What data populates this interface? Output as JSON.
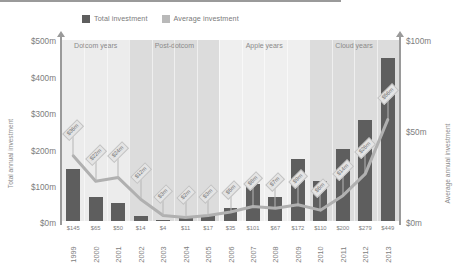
{
  "legend": {
    "items": [
      {
        "label": "Total investment",
        "color": "#5e5e5e",
        "key": "total"
      },
      {
        "label": "Average investment",
        "color": "#b9b9b9",
        "key": "average"
      }
    ]
  },
  "axes": {
    "left_title": "Total annual investment",
    "right_title": "Average annual investment",
    "left_ticks": [
      "$500m",
      "$400m",
      "$300m",
      "$200m",
      "$100m",
      "$0m"
    ],
    "right_ticks": [
      "$100m",
      "$50m",
      "$0m"
    ]
  },
  "chart_data": {
    "type": "bar",
    "title": "",
    "subtitle": "",
    "xlabel": "",
    "ylabel": "Total annual investment",
    "y2label": "Average annual investment",
    "grid": false,
    "legend_position": "top",
    "categories": [
      "1999",
      "2000",
      "2001",
      "2002",
      "2003",
      "2004",
      "2005",
      "2006",
      "2007",
      "2008",
      "2009",
      "2010",
      "2011",
      "2012",
      "2013"
    ],
    "ylim": [
      0,
      500
    ],
    "y2lim": [
      0,
      100
    ],
    "yticks": [
      0,
      100,
      200,
      300,
      400,
      500
    ],
    "y2ticks": [
      0,
      50,
      100
    ],
    "ytick_labels": [
      "$0m",
      "$100m",
      "$200m",
      "$300m",
      "$400m",
      "$500m"
    ],
    "y2tick_labels": [
      "$0m",
      "$50m",
      "$100m"
    ],
    "series": [
      {
        "name": "Total investment",
        "type": "bar",
        "axis": "left",
        "color": "#5e5e5e",
        "values": [
          145,
          65,
          50,
          14,
          4,
          11,
          17,
          35,
          101,
          67,
          172,
          110,
          200,
          279,
          449
        ],
        "data_labels": [
          "$145",
          "$65",
          "$50",
          "$14",
          "$4",
          "$11",
          "$17",
          "$35",
          "$101",
          "$67",
          "$172",
          "$110",
          "$200",
          "$279",
          "$449"
        ]
      },
      {
        "name": "Average investment",
        "type": "line",
        "axis": "right",
        "color": "#b0b0b0",
        "values": [
          36,
          22,
          24,
          12,
          3,
          2,
          3,
          5,
          8,
          7,
          9,
          6,
          14,
          26,
          56
        ],
        "data_labels": [
          "$36m",
          "$22m",
          "$24m",
          "$12m",
          "$3m",
          "$2m",
          "$3m",
          "$5m",
          "$8m",
          "$7m",
          "$9m",
          "$6m",
          "$14m",
          "$26m",
          "$56m"
        ]
      }
    ],
    "bands": [
      {
        "label": "Dotcom years",
        "start": "1999",
        "end": "2001",
        "color": "#ececec"
      },
      {
        "label": "Post-dotcom",
        "start": "2002",
        "end": "2005",
        "color": "#dcdcdc"
      },
      {
        "label": "Apple years",
        "start": "2006",
        "end": "2009",
        "color": "#efefef"
      },
      {
        "label": "Cloud years",
        "start": "2010",
        "end": "2013",
        "color": "#dcdcdc"
      }
    ]
  }
}
